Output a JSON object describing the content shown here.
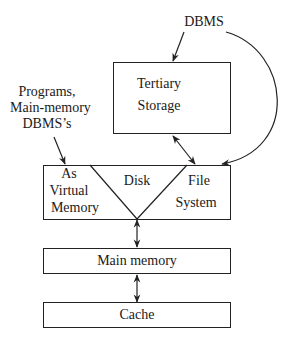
{
  "diagram": {
    "nodes": {
      "dbms": {
        "label": "DBMS"
      },
      "programs": {
        "line1": "Programs,",
        "line2": "Main-memory",
        "line3": "DBMS’s"
      },
      "tertiary": {
        "line1": "Tertiary",
        "line2": "Storage"
      },
      "disk": {
        "virtual_memory": {
          "line1": "As",
          "line2": "Virtual",
          "line3": "Memory"
        },
        "center": "Disk",
        "file_system": {
          "line1": "File",
          "line2": "System"
        }
      },
      "main_memory": {
        "label": "Main memory"
      },
      "cache": {
        "label": "Cache"
      }
    },
    "edges": [
      {
        "from": "DBMS",
        "to": "Tertiary Storage",
        "type": "arrow"
      },
      {
        "from": "DBMS",
        "to": "Disk (File System)",
        "type": "curved-arrow"
      },
      {
        "from": "Programs, Main-memory DBMS's",
        "to": "Disk (As Virtual Memory)",
        "type": "arrow"
      },
      {
        "from": "Tertiary Storage",
        "to": "Disk (File System)",
        "type": "double-arrow"
      },
      {
        "from": "Disk",
        "to": "Main memory",
        "type": "double-arrow"
      },
      {
        "from": "Main memory",
        "to": "Cache",
        "type": "double-arrow"
      }
    ],
    "colors": {
      "line": "#222222",
      "text": "#1a1a1a",
      "background": "#ffffff"
    }
  }
}
